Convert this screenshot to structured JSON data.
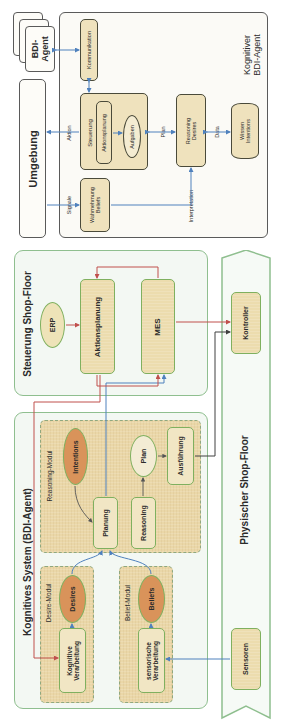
{
  "top_diagram": {
    "frame_title": "Kognitiver\nBDI-Agent",
    "bdi_agent_stack": "BDI-\nAgent",
    "umgebung": "Umgebung",
    "kommunikation": "Kommunikation",
    "steuerung": "Steuerung",
    "aktionsplanung": "Aktionsplanung",
    "aufgaben": "Aufgaben",
    "wahrnehmung": "Wahrnehmung\nBeliefs",
    "reasoning": "Reasoning\nDesires",
    "wissen": "Wissen\nIntentions",
    "labels": {
      "aktion": "Aktion",
      "signale": "Signale",
      "plan": "Plan",
      "data": "Data",
      "interpretation": "Interpretation"
    }
  },
  "steuerung_shop_floor": {
    "title": "Steuerung Shop-Floor",
    "erp": "ERP",
    "aktionsplanung": "Aktionsplanung",
    "mes": "MES"
  },
  "kognitives_system": {
    "title": "Kognitives System (BDI-Agent)",
    "reasoning_modul": {
      "title": "Reasoning-Modul",
      "intentions": "Intentions",
      "planung": "Planung",
      "reasoning": "Reasoning",
      "plan": "Plan",
      "ausfuehrung": "Ausführung"
    },
    "desire_modul": {
      "title": "Desire-Modul",
      "desires": "Desires",
      "kognitive_verarbeitung": "Kognitive\nVerarbeitung"
    },
    "belief_modul": {
      "title": "Belief-Modul",
      "beliefs": "Beliefs",
      "sensorische_verarbeitung": "sensorische\nVerarbeitung"
    }
  },
  "physischer_shop_floor": {
    "title": "Physischer Shop-Floor",
    "kontroller": "Kontroller",
    "sensoren": "Sensoren"
  },
  "colors": {
    "red_connector": "#c0504d",
    "blue_connector": "#4f81bd",
    "dark_connector": "#404040",
    "green_border": "#8fbf8f",
    "orange_fill": "#d9935a",
    "tan_fill": "#efe2bd"
  }
}
